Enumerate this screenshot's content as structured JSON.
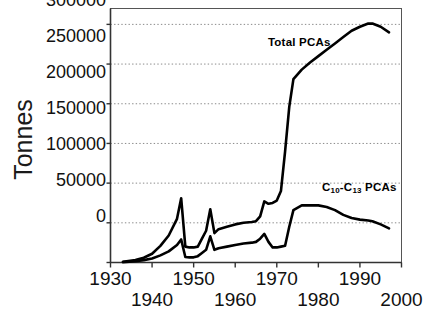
{
  "chart_data": {
    "type": "line",
    "title": "",
    "xlabel": "",
    "ylabel": "Tonnes",
    "xlim": [
      1930,
      2000
    ],
    "ylim": [
      0,
      320000
    ],
    "grid": true,
    "grid_axis": "y",
    "legend_position": "inline-annotations",
    "y_ticks": [
      0,
      50000,
      100000,
      150000,
      200000,
      250000,
      300000
    ],
    "y_tick_labels": [
      "0",
      "50000",
      "100000",
      "150000",
      "200000",
      "250000",
      "300000"
    ],
    "x_ticks": [
      1930,
      1940,
      1950,
      1960,
      1970,
      1980,
      1990,
      2000
    ],
    "x_tick_labels": [
      "1930",
      "1940",
      "1950",
      "1960",
      "1970",
      "1980",
      "1990",
      "2000"
    ],
    "x_tick_label_rows": [
      0,
      1,
      0,
      1,
      0,
      1,
      0,
      1
    ],
    "series": [
      {
        "name": "Total PCAs",
        "label_text": "Total PCAs",
        "color": "#000000",
        "x": [
          1933,
          1936,
          1938,
          1940,
          1942,
          1944,
          1946,
          1947,
          1948,
          1949,
          1950,
          1951,
          1952,
          1953,
          1954,
          1955,
          1956,
          1958,
          1960,
          1962,
          1964,
          1965,
          1966,
          1967,
          1968,
          1969,
          1970,
          1971,
          1972,
          1973,
          1974,
          1976,
          1978,
          1980,
          1982,
          1984,
          1986,
          1988,
          1990,
          1992,
          1993,
          1995,
          1997
        ],
        "y": [
          1000,
          3000,
          6000,
          11000,
          21000,
          34000,
          55000,
          81000,
          20000,
          19000,
          19000,
          20000,
          30000,
          40000,
          67000,
          37000,
          42000,
          45000,
          48000,
          50000,
          51000,
          52000,
          58000,
          77000,
          74000,
          75000,
          78000,
          90000,
          140000,
          196000,
          231000,
          243000,
          252000,
          260000,
          268000,
          276000,
          284000,
          292000,
          297000,
          301000,
          301000,
          297000,
          290000
        ]
      },
      {
        "name": "C10-C13 PCAs",
        "label_text": "C10-C13 PCAs",
        "label_prefix": "C",
        "label_sub1": "10",
        "label_mid": "-C",
        "label_sub2": "13",
        "label_suffix": " PCAs",
        "color": "#000000",
        "x": [
          1933,
          1936,
          1938,
          1940,
          1942,
          1944,
          1946,
          1947,
          1948,
          1949,
          1950,
          1951,
          1952,
          1953,
          1954,
          1955,
          1956,
          1958,
          1960,
          1962,
          1964,
          1965,
          1966,
          1967,
          1968,
          1969,
          1970,
          1971,
          1972,
          1973,
          1974,
          1976,
          1978,
          1980,
          1982,
          1984,
          1986,
          1988,
          1990,
          1992,
          1993,
          1995,
          1997
        ],
        "y": [
          500,
          1500,
          3000,
          5000,
          9000,
          14000,
          22000,
          29000,
          7000,
          6500,
          6500,
          8000,
          12000,
          16000,
          33000,
          16000,
          18000,
          20000,
          22000,
          24000,
          25000,
          26000,
          30000,
          36000,
          26000,
          19000,
          19000,
          20000,
          21000,
          45000,
          66000,
          72000,
          72000,
          72000,
          70000,
          66000,
          60000,
          56000,
          54000,
          53000,
          52000,
          48000,
          43000
        ]
      }
    ]
  },
  "axis": {
    "y_title": "Tonnes"
  }
}
